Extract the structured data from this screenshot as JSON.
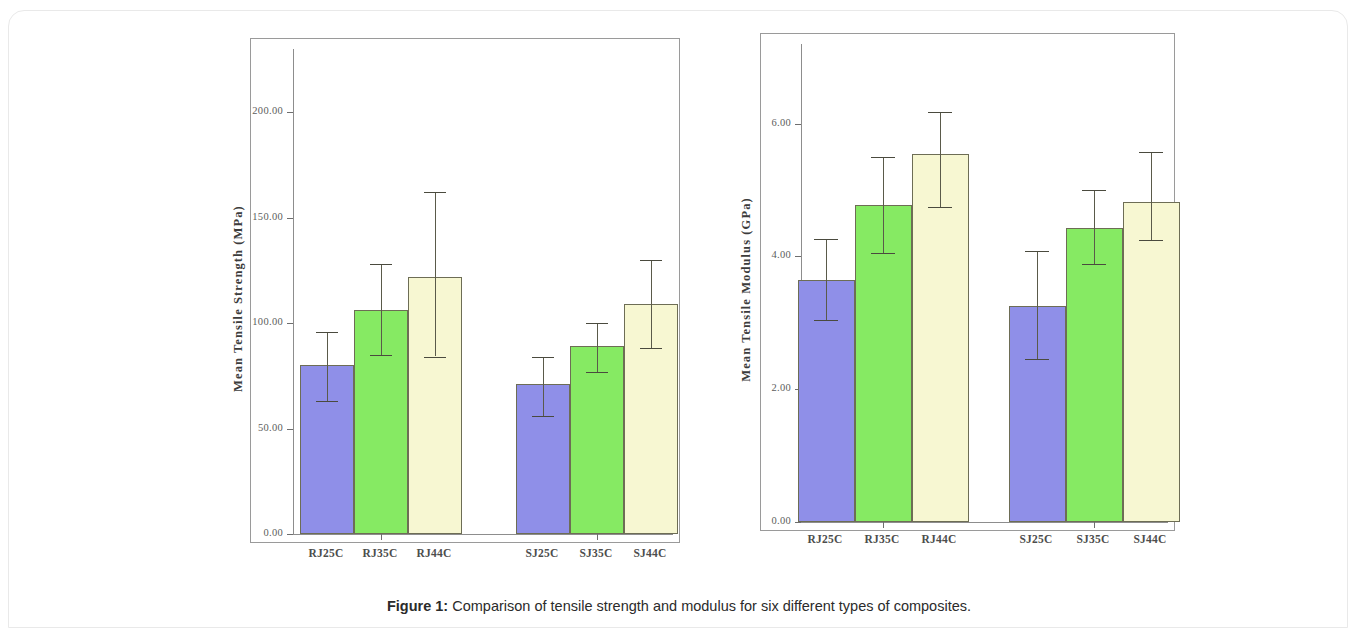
{
  "caption": {
    "label": "Figure 1:",
    "text": " Comparison of tensile strength and modulus for six different types of composites."
  },
  "colors": {
    "series_purple": "#8f8fe8",
    "series_green": "#86ea63",
    "series_cream": "#f7f7d2",
    "bar_outline": "#6d6d55",
    "axis": "#8d8d8d",
    "text": "#4d4d4d",
    "page_background": "#ffffff"
  },
  "chart_data": [
    {
      "type": "bar",
      "id": "tensile-strength",
      "title": "",
      "xlabel": "",
      "ylabel": "Mean Tensile Strength (MPa)",
      "categories": [
        "RJ25C",
        "RJ35C",
        "RJ44C",
        "SJ25C",
        "SJ35C",
        "SJ44C"
      ],
      "values": [
        80.0,
        106.0,
        122.0,
        71.0,
        89.0,
        109.0
      ],
      "error_low": [
        63.0,
        85.0,
        84.0,
        56.0,
        77.0,
        88.0
      ],
      "error_high": [
        96.0,
        128.0,
        162.0,
        84.0,
        100.0,
        130.0
      ],
      "bar_colors": [
        "#8f8fe8",
        "#86ea63",
        "#f7f7d2",
        "#8f8fe8",
        "#86ea63",
        "#f7f7d2"
      ],
      "groups": [
        {
          "name": "RJ",
          "categories": [
            "RJ25C",
            "RJ35C",
            "RJ44C"
          ]
        },
        {
          "name": "SJ",
          "categories": [
            "SJ25C",
            "SJ35C",
            "SJ44C"
          ]
        }
      ],
      "ylim": [
        0,
        230
      ],
      "yticks": [
        0,
        50,
        100,
        150,
        200
      ],
      "ytick_labels": [
        "0.00",
        "50.00",
        "100.00",
        "150.00",
        "200.00"
      ],
      "grid": false,
      "legend": "none"
    },
    {
      "type": "bar",
      "id": "tensile-modulus",
      "title": "",
      "xlabel": "",
      "ylabel": "Mean Tensile Modulus (GPa)",
      "categories": [
        "RJ25C",
        "RJ35C",
        "RJ44C",
        "SJ25C",
        "SJ35C",
        "SJ44C"
      ],
      "values": [
        3.65,
        4.78,
        5.55,
        3.25,
        4.43,
        4.82
      ],
      "error_low": [
        3.05,
        4.05,
        4.75,
        2.45,
        3.88,
        4.25
      ],
      "error_high": [
        4.27,
        5.5,
        6.18,
        4.08,
        5.0,
        5.58
      ],
      "bar_colors": [
        "#8f8fe8",
        "#86ea63",
        "#f7f7d2",
        "#8f8fe8",
        "#86ea63",
        "#f7f7d2"
      ],
      "groups": [
        {
          "name": "RJ",
          "categories": [
            "RJ25C",
            "RJ35C",
            "RJ44C"
          ]
        },
        {
          "name": "SJ",
          "categories": [
            "SJ25C",
            "SJ35C",
            "SJ44C"
          ]
        }
      ],
      "ylim": [
        0,
        7.2
      ],
      "yticks": [
        0,
        2,
        4,
        6
      ],
      "ytick_labels": [
        "0.00",
        "2.00",
        "4.00",
        "6.00"
      ],
      "grid": false,
      "legend": "none"
    }
  ]
}
